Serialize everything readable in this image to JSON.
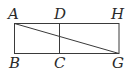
{
  "diagram": {
    "title": "",
    "stroke_color": "#3a3a3a",
    "labels": {
      "A": "A",
      "D": "D",
      "H": "H",
      "B": "B",
      "C": "C",
      "G": "G"
    },
    "points": {
      "A": [
        14,
        23
      ],
      "D": [
        59,
        23
      ],
      "H": [
        119,
        23
      ],
      "B": [
        14,
        53
      ],
      "C": [
        59,
        53
      ],
      "G": [
        119,
        53
      ]
    },
    "segments": [
      [
        "A",
        "H"
      ],
      [
        "B",
        "G"
      ],
      [
        "A",
        "B"
      ],
      [
        "D",
        "C"
      ],
      [
        "H",
        "G"
      ],
      [
        "A",
        "G"
      ]
    ]
  }
}
